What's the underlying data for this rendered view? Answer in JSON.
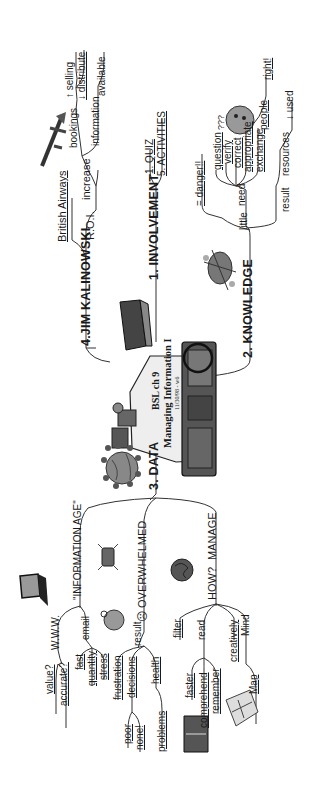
{
  "center": {
    "line1": "BSL  ch 9",
    "line2": "Managing Information I",
    "date": "11/30/98 - w6"
  },
  "branches": {
    "involvement": {
      "label": "1. INVOLVEMENT",
      "children": [
        "1. QUIZ",
        "5. ACTIVITIES"
      ]
    },
    "knowledge": {
      "label": "2. KNOWLEDGE",
      "little": "little",
      "need": "need",
      "need_children": [
        "= danger!!",
        "question",
        "verify",
        "correct",
        "appropriate",
        "exchange",
        "people",
        "right!"
      ],
      "result": "result",
      "result_children": [
        "resources",
        "↓ used"
      ]
    },
    "data": {
      "label": "3. DATA",
      "information_age": {
        "label": "\"INFORMATION AGE\"",
        "www": "W.W.W.",
        "www_children": [
          "value?",
          "accurate?"
        ],
        "email": "email",
        "email_children": [
          "fast",
          "quantity",
          "stress"
        ]
      },
      "overwhelmed": {
        "label": "☹ OVERWHELMED",
        "result": "result",
        "result_children": [
          "frustration",
          "decisions",
          "health"
        ],
        "decisions_children": [
          "poor",
          "none!"
        ],
        "health_children": [
          "problems"
        ]
      },
      "manage": {
        "label": "MANAGE",
        "how": "HOW?",
        "how_children": [
          "filter",
          "read",
          "creatively",
          "Mind"
        ],
        "read_children": [
          "faster",
          "comprehend",
          "remember"
        ],
        "mind_children": [
          "Map"
        ]
      }
    },
    "jim": {
      "label": "4.JIM KALINOWSKI",
      "roi": "R.O.I.",
      "british_airways": "British Airways",
      "increase": "increase",
      "bookings": "bookings",
      "bookings_children": [
        "↑ selling",
        "↓ distribute"
      ],
      "information": "information",
      "information_children": [
        "available"
      ]
    }
  },
  "icons": [
    "airplane-icon",
    "confused-face-icon",
    "wild-creature-icon",
    "computer-user-icon",
    "book-stack-icon",
    "globe-icon",
    "laptop-icon",
    "pager-icon",
    "brain-icon",
    "stressed-face-icon",
    "open-book-icon",
    "map-icon"
  ]
}
